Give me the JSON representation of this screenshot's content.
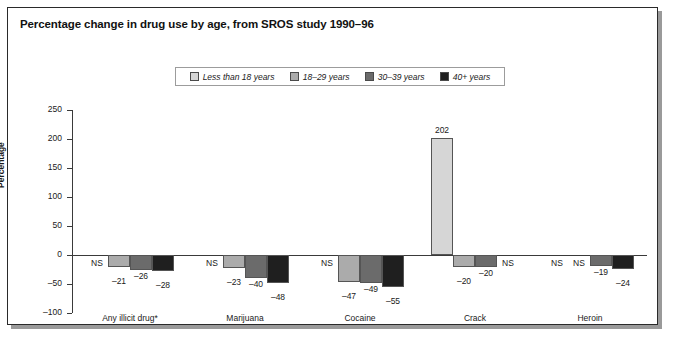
{
  "figure": {
    "title": "Percentage change in drug use by age, from SROS study 1990–96"
  },
  "chart_data": {
    "type": "bar",
    "title": "Percentage change in drug use by age, from SROS study 1990–96",
    "xlabel": "",
    "ylabel": "Percentage",
    "ylim": [
      -100,
      250
    ],
    "yticks": [
      -100,
      -50,
      0,
      50,
      100,
      150,
      200,
      250
    ],
    "ytick_labels": [
      "–100",
      "–50",
      "0",
      "50",
      "100",
      "150",
      "200",
      "250"
    ],
    "grid": false,
    "legend_position": "top-center",
    "not_significant_marker": "NS",
    "categories": [
      "Any illicit drug*",
      "Marijuana",
      "Cocaine",
      "Crack",
      "Heroin"
    ],
    "series": [
      {
        "name": "Less than 18 years",
        "color": "#d6d6d6",
        "values": [
          null,
          null,
          null,
          202,
          null
        ],
        "labels": [
          "NS",
          "NS",
          "NS",
          "202",
          "NS"
        ]
      },
      {
        "name": "18–29 years",
        "color": "#ababab",
        "values": [
          -21,
          -23,
          -47,
          -20,
          null
        ],
        "labels": [
          "–21",
          "–23",
          "–47",
          "–20",
          "NS"
        ]
      },
      {
        "name": "30–39 years",
        "color": "#6b6b6b",
        "values": [
          -26,
          -40,
          -49,
          -20,
          -19
        ],
        "labels": [
          "–26",
          "–40",
          "–49",
          "–20",
          "–19"
        ]
      },
      {
        "name": "40+ years",
        "color": "#1f1f1f",
        "values": [
          -28,
          -48,
          -55,
          null,
          -24
        ],
        "labels": [
          "–28",
          "–48",
          "–55",
          "NS",
          "–24"
        ]
      }
    ]
  },
  "legend": {
    "items": [
      {
        "label": "Less than 18 years",
        "color": "#d6d6d6"
      },
      {
        "label": "18–29 years",
        "color": "#ababab"
      },
      {
        "label": "30–39 years",
        "color": "#6b6b6b"
      },
      {
        "label": "40+  years",
        "color": "#1f1f1f"
      }
    ]
  }
}
